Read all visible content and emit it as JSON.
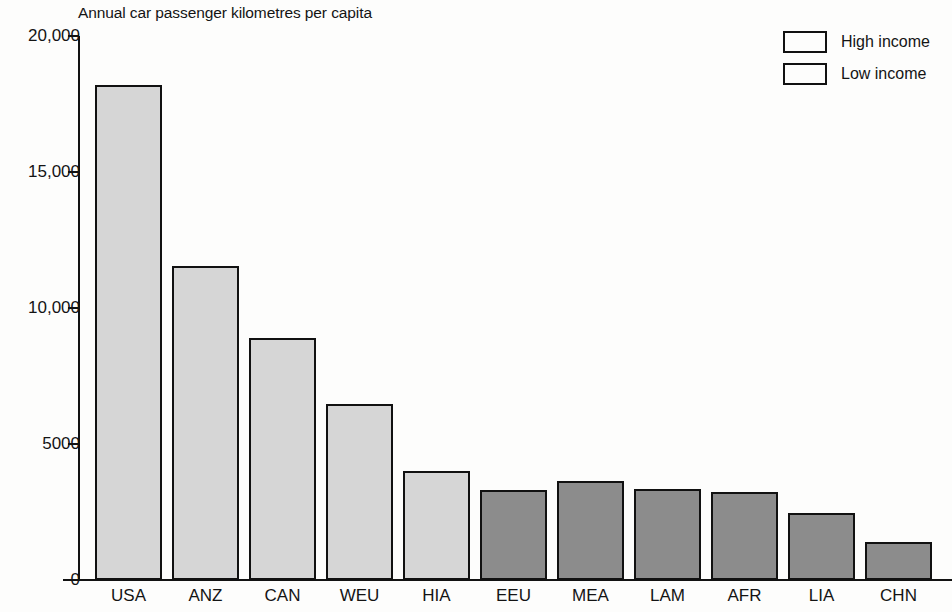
{
  "chart_data": {
    "type": "bar",
    "title": "Annual car passenger kilometres per capita",
    "xlabel": "",
    "ylabel": "",
    "ylim": [
      0,
      20000
    ],
    "grid": false,
    "legend_position": "top-right",
    "ytick_labels": [
      "20,000",
      "15,000",
      "10,000",
      "5000",
      "0"
    ],
    "ytick_values": [
      20000,
      15000,
      10000,
      5000,
      0
    ],
    "categories": [
      "USA",
      "ANZ",
      "CAN",
      "WEU",
      "HIA",
      "EEU",
      "MEA",
      "LAM",
      "AFR",
      "LIA",
      "CHN"
    ],
    "values": [
      18200,
      11540,
      8900,
      6470,
      4000,
      3310,
      3640,
      3350,
      3230,
      2460,
      1400
    ],
    "groups": [
      "High income",
      "High income",
      "High income",
      "High income",
      "High income",
      "Low income",
      "Low income",
      "Low income",
      "Low income",
      "Low income",
      "Low income"
    ],
    "legend": [
      {
        "label": "High income",
        "color": "#d6d6d6"
      },
      {
        "label": "Low income",
        "color": "#8c8c8c"
      }
    ],
    "colors": {
      "high_income": "#d6d6d6",
      "low_income": "#8c8c8c",
      "axis": "#121212",
      "border": "#111111",
      "background": "#fdfdfc"
    }
  }
}
